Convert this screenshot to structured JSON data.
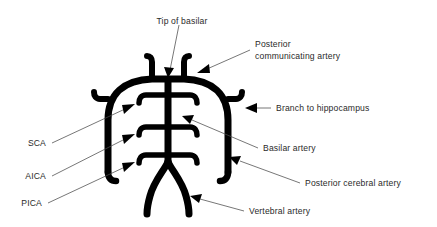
{
  "figure": {
    "background_color": "#ffffff",
    "vessel_color": "#000000",
    "leader_color": "#4a4a4a",
    "text_color": "#2a2a2a"
  },
  "labels": {
    "tip_of_basilar": "Tip of basilar",
    "posterior_communicating_line1": "Posterior",
    "posterior_communicating_line2": "communicating artery",
    "branch_to_hippocampus": "Branch to hippocampus",
    "basilar_artery": "Basilar artery",
    "posterior_cerebral_artery": "Posterior cerebral artery",
    "vertebral_artery": "Vertebral artery",
    "sca": "SCA",
    "aica": "AICA",
    "pica": "PICA"
  },
  "structures": [
    {
      "name": "basilar-trunk",
      "label": "Basilar artery"
    },
    {
      "name": "basilar-tip",
      "label": "Tip of basilar"
    },
    {
      "name": "posterior-communicating-artery",
      "label": "Posterior communicating artery"
    },
    {
      "name": "posterior-cerebral-artery",
      "label": "Posterior cerebral artery"
    },
    {
      "name": "hippocampal-branch",
      "label": "Branch to hippocampus"
    },
    {
      "name": "superior-cerebellar-artery",
      "label": "SCA"
    },
    {
      "name": "anterior-inferior-cerebellar-artery",
      "label": "AICA"
    },
    {
      "name": "posterior-inferior-cerebellar-artery",
      "label": "PICA"
    },
    {
      "name": "vertebral-artery",
      "label": "Vertebral artery"
    }
  ]
}
